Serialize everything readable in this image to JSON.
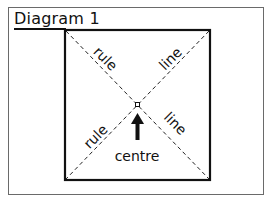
{
  "figure": {
    "title": "Diagram 1",
    "labels": {
      "top_left_diagonal": "rule",
      "top_right_diagonal": "line",
      "bottom_left_diagonal": "rule",
      "bottom_right_diagonal": "line",
      "centre": "centre"
    },
    "markers": {
      "centre_point": "small-square-marker",
      "arrow": "up-arrow"
    },
    "colors": {
      "ink": "#111111",
      "outer_frame": "#6a6a6a",
      "background": "#ffffff"
    }
  }
}
